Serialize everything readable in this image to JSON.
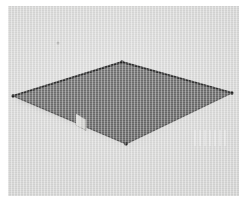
{
  "image": {
    "kind": "photograph",
    "subject": "flat square panel viewed in perspective",
    "caption": "",
    "width_px": 247,
    "height_px": 208
  },
  "colors": {
    "page_margin": "#ffffff",
    "background": "#d4d4d3",
    "background_shadow": "#c3c3c2",
    "panel_fill": "#6d6d6d",
    "panel_fill_light": "#787878",
    "panel_fill_dark": "#636363",
    "panel_edge": "#2b2b2b",
    "panel_edge_highlight": "#8a8a8a",
    "clip_light": "#cfcfcd",
    "clip_shadow": "#8f8f8d",
    "speck": "#9a9a98"
  },
  "photo_region": {
    "left": 8,
    "top": 6,
    "width": 231,
    "height": 190
  },
  "panel": {
    "name": "square-panel",
    "shape": "quadrilateral",
    "vertices": [
      {
        "label": "top",
        "x": 114,
        "y": 56
      },
      {
        "label": "right",
        "x": 224,
        "y": 87
      },
      {
        "label": "bottom",
        "x": 118,
        "y": 138
      },
      {
        "label": "left",
        "x": 5,
        "y": 90
      }
    ],
    "edge_width_px": 1.4
  },
  "clip": {
    "name": "edge-clip",
    "label": "",
    "x": 68,
    "y": 108,
    "width": 10,
    "height": 11
  },
  "speck": {
    "name": "surface-speck",
    "x": 50,
    "y": 37,
    "radius": 1.6
  },
  "artifacts": {
    "streaks_label": ""
  }
}
